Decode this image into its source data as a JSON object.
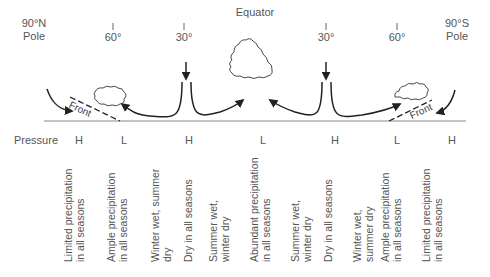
{
  "title": "Equator",
  "poles": {
    "north": {
      "line1": "90°N",
      "line2": "Pole"
    },
    "south": {
      "line1": "90°S",
      "line2": "Pole"
    }
  },
  "latitudes": [
    {
      "label": "60°",
      "x": 113
    },
    {
      "label": "30°",
      "x": 184
    },
    {
      "label": "30°",
      "x": 326
    },
    {
      "label": "60°",
      "x": 397
    }
  ],
  "fronts": [
    {
      "label": "Front",
      "side": "north"
    },
    {
      "label": "Front",
      "side": "south"
    }
  ],
  "pressure": {
    "label": "Pressure",
    "values": [
      {
        "v": "H",
        "x": 78
      },
      {
        "v": "L",
        "x": 123
      },
      {
        "v": "H",
        "x": 188
      },
      {
        "v": "L",
        "x": 262
      },
      {
        "v": "H",
        "x": 334
      },
      {
        "v": "L",
        "x": 396
      },
      {
        "v": "H",
        "x": 451
      }
    ]
  },
  "zones": [
    {
      "line1": "Limited precipitation",
      "line2": "in all seasons",
      "x": 62
    },
    {
      "line1": "Ample precipitation",
      "line2": "in all seasons",
      "x": 105
    },
    {
      "line1": "Winter wet, summer",
      "line2": "dry",
      "x": 149
    },
    {
      "line1": "Dry in all seasons",
      "line2": "",
      "x": 182
    },
    {
      "line1": "Summer wet,",
      "line2": "winter dry",
      "x": 207
    },
    {
      "line1": "Abundant precipitation",
      "line2": "in all seasons",
      "x": 248
    },
    {
      "line1": "Summer wet,",
      "line2": "winter dry",
      "x": 289
    },
    {
      "line1": "Dry in all seasons",
      "line2": "",
      "x": 322
    },
    {
      "line1": "Winter wet,",
      "line2": "summer dry",
      "x": 351
    },
    {
      "line1": "Ample precipitation",
      "line2": "in all seasons",
      "x": 379
    },
    {
      "line1": "Limited precipitation",
      "line2": "in all seasons",
      "x": 420
    }
  ]
}
